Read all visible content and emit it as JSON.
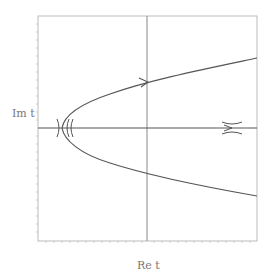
{
  "diagram": {
    "type": "complex-plane-contour",
    "y_axis_label": "Im t",
    "x_axis_label": "Re t",
    "colors": {
      "frame": "#bbbbbb",
      "axes": "#666666",
      "curve": "#555555",
      "label": "#777777"
    },
    "contour": {
      "shape": "parabola opening right",
      "direction_arrow": "on upper branch pointing right"
    },
    "markers": [
      {
        "name": "left-branch-cut-brackets",
        "glyph": ")(("
      },
      {
        "name": "right-saddle-marker",
        "glyph": "converging arcs"
      }
    ]
  }
}
